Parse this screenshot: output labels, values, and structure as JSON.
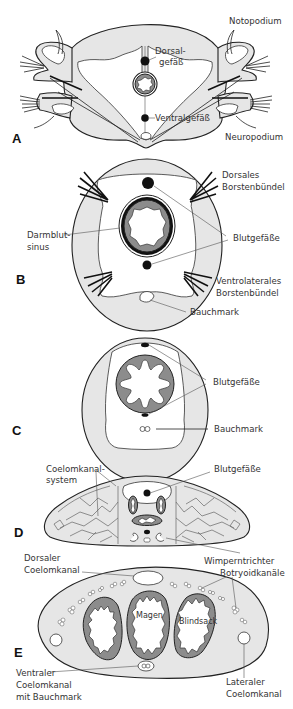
{
  "figure": {
    "colors": {
      "tissue": "#e6e6e6",
      "gut_wall": "#8c8c8c",
      "vessel": "#111111",
      "outline": "#222222",
      "label_text": "#333333"
    }
  },
  "panels": [
    {
      "id": "A",
      "label": "A",
      "annotations": {
        "notopodium": "Notopodium",
        "dorsal_vessel": "Dorsal-\ngefäß",
        "dorsal_vessel_l1": "Dorsal-",
        "dorsal_vessel_l2": "gefäß",
        "ventral_vessel": "Ventralgefäß",
        "neuropodium": "Neuropodium"
      }
    },
    {
      "id": "B",
      "label": "B",
      "annotations": {
        "dorsal_bristles_l1": "Dorsales",
        "dorsal_bristles_l2": "Borstenbündel",
        "gut_sinus_l1": "Darmblut-",
        "gut_sinus_l2": "sinus",
        "blood_vessels": "Blutgefäße",
        "ventrolateral_bristles_l1": "Ventrolaterales",
        "ventrolateral_bristles_l2": "Borstenbündel",
        "nerve_cord": "Bauchmark"
      }
    },
    {
      "id": "C",
      "label": "C",
      "annotations": {
        "blood_vessels": "Blutgefäße",
        "nerve_cord": "Bauchmark"
      }
    },
    {
      "id": "D",
      "label": "D",
      "annotations": {
        "coelom_canal_l1": "Coelomkanal-",
        "coelom_canal_l2": "system",
        "blood_vessels": "Blutgefäße",
        "ciliated_funnel": "Wimperntrichter"
      }
    },
    {
      "id": "E",
      "label": "E",
      "annotations": {
        "dorsal_canal_l1": "Dorsaler",
        "dorsal_canal_l2": "Coelomkanal",
        "botryoid_canals": "Botryoidkanäle",
        "stomach": "Magen",
        "blind_sac": "Blindsack",
        "ventral_canal_l1": "Ventraler",
        "ventral_canal_l2": "Coelomkanal",
        "ventral_canal_l3": "mit Bauchmark",
        "lateral_canal_l1": "Lateraler",
        "lateral_canal_l2": "Coelomkanal"
      }
    }
  ]
}
